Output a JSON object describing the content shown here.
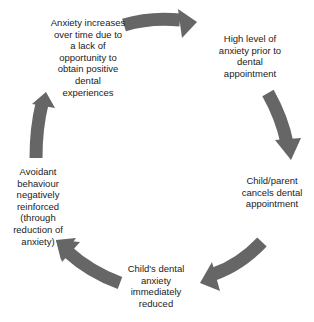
{
  "diagram": {
    "type": "cycle",
    "arrow_color": "#666666",
    "text_color": "#222222",
    "nodes": [
      {
        "id": "n0",
        "label": "Anxiety increases\nover time due to\na lack of\nopportunity to\nobtain positive\ndental\nexperiences"
      },
      {
        "id": "n1",
        "label": "High level of\nanxiety prior to\ndental\nappointment"
      },
      {
        "id": "n2",
        "label": "Child/parent\ncancels dental\nappointment"
      },
      {
        "id": "n3",
        "label": "Child's dental\nanxiety\nimmediately\nreduced"
      },
      {
        "id": "n4",
        "label": "Avoidant\nbehaviour\nnegatively\nreinforced\n(through\nreduction of\nanxiety)"
      }
    ],
    "edges": [
      {
        "from": "n0",
        "to": "n1"
      },
      {
        "from": "n1",
        "to": "n2"
      },
      {
        "from": "n2",
        "to": "n3"
      },
      {
        "from": "n3",
        "to": "n4"
      },
      {
        "from": "n4",
        "to": "n0"
      }
    ]
  }
}
